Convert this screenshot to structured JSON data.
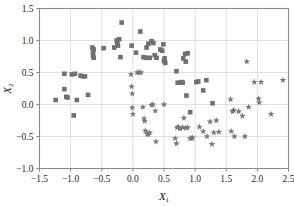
{
  "chart_data": {
    "type": "scatter",
    "title": "",
    "xlabel": "X1",
    "ylabel": "X2",
    "xlabel_base": "X",
    "xlabel_sub": "1",
    "ylabel_base": "X",
    "ylabel_sub": "2",
    "xlim": [
      -1.5,
      2.5
    ],
    "ylim": [
      -1.0,
      1.5
    ],
    "xticks": [
      -1.5,
      -1.0,
      -0.5,
      0.0,
      0.5,
      1.0,
      1.5,
      2.0,
      2.5
    ],
    "xticklabels": [
      "−1.5",
      "−1.0",
      "−0.5",
      "0.0",
      "0.5",
      "1.0",
      "1.5",
      "2.0",
      "2.5"
    ],
    "yticks": [
      -1.0,
      -0.5,
      0.0,
      0.5,
      1.0,
      1.5
    ],
    "yticklabels": [
      "−1.0",
      "−0.5",
      "0.0",
      "0.5",
      "1.0",
      "1.5"
    ],
    "grid": true,
    "grid_color": "#d8d8d8",
    "frame_color": "#8a8a8a",
    "legend": null,
    "series": [
      {
        "name": "class-1",
        "marker": "square",
        "color": "#6f7073",
        "size": 4.6,
        "points": [
          [
            -1.24,
            0.07
          ],
          [
            -1.1,
            0.48
          ],
          [
            -1.1,
            0.24
          ],
          [
            -1.07,
            0.12
          ],
          [
            -1.05,
            0.11
          ],
          [
            -0.98,
            0.47
          ],
          [
            -0.95,
            -0.17
          ],
          [
            -0.93,
            0.48
          ],
          [
            -0.9,
            0.07
          ],
          [
            -0.84,
            0.45
          ],
          [
            -0.8,
            0.44
          ],
          [
            -0.77,
            0.44
          ],
          [
            -0.72,
            0.15
          ],
          [
            -0.65,
            0.89
          ],
          [
            -0.64,
            0.82
          ],
          [
            -0.64,
            0.76
          ],
          [
            -0.63,
            0.73
          ],
          [
            -0.63,
            0.86
          ],
          [
            -0.47,
            0.88
          ],
          [
            -0.3,
            0.89
          ],
          [
            -0.26,
            1.0
          ],
          [
            -0.25,
            0.96
          ],
          [
            -0.24,
            0.92
          ],
          [
            -0.22,
            1.02
          ],
          [
            -0.2,
            0.74
          ],
          [
            -0.18,
            1.28
          ],
          [
            -0.02,
            0.92
          ],
          [
            0.05,
            0.81
          ],
          [
            0.12,
            1.14
          ],
          [
            0.17,
            0.74
          ],
          [
            0.21,
            0.73
          ],
          [
            0.22,
            0.89
          ],
          [
            0.25,
            0.95
          ],
          [
            0.27,
            0.73
          ],
          [
            0.3,
            0.99
          ],
          [
            0.33,
            0.96
          ],
          [
            0.35,
            0.77
          ],
          [
            0.38,
            0.73
          ],
          [
            0.44,
            0.86
          ],
          [
            0.47,
            0.84
          ],
          [
            0.49,
            0.94
          ],
          [
            0.5,
            0.68
          ],
          [
            0.51,
            0.72
          ],
          [
            0.52,
            0.65
          ],
          [
            0.7,
            0.52
          ],
          [
            0.72,
            0.34
          ],
          [
            0.78,
            0.35
          ],
          [
            0.8,
            0.34
          ],
          [
            0.81,
            0.72
          ],
          [
            0.84,
            0.79
          ],
          [
            0.85,
            0.67
          ],
          [
            0.86,
            0.14
          ],
          [
            0.88,
            0.8
          ],
          [
            0.92,
            -0.12
          ],
          [
            1.02,
            0.35
          ],
          [
            1.05,
            0.36
          ],
          [
            1.13,
            0.22
          ],
          [
            1.18,
            0.38
          ],
          [
            1.28,
            0.02
          ]
        ]
      },
      {
        "name": "class-2",
        "marker": "star",
        "color": "#77787c",
        "size": 4.4,
        "points": [
          [
            -0.03,
            0.47
          ],
          [
            -0.02,
            0.28
          ],
          [
            -0.01,
            0.17
          ],
          [
            -0.01,
            -0.05
          ],
          [
            0.0,
            -0.15
          ],
          [
            0.07,
            0.5
          ],
          [
            0.1,
            0.5
          ],
          [
            0.13,
            0.5
          ],
          [
            0.16,
            -0.04
          ],
          [
            0.18,
            -0.22
          ],
          [
            0.19,
            -0.26
          ],
          [
            0.2,
            -0.41
          ],
          [
            0.23,
            -0.46
          ],
          [
            0.25,
            -0.47
          ],
          [
            0.27,
            -0.44
          ],
          [
            0.3,
            -0.01
          ],
          [
            0.32,
            0.0
          ],
          [
            0.36,
            -0.1
          ],
          [
            0.37,
            -0.58
          ],
          [
            0.5,
            0.0
          ],
          [
            0.68,
            -0.53
          ],
          [
            0.7,
            -0.61
          ],
          [
            0.71,
            -0.36
          ],
          [
            0.73,
            -0.35
          ],
          [
            0.76,
            -0.38
          ],
          [
            0.8,
            -0.36
          ],
          [
            0.82,
            -0.21
          ],
          [
            0.85,
            -0.37
          ],
          [
            0.88,
            -0.36
          ],
          [
            0.92,
            -0.53
          ],
          [
            0.94,
            -0.53
          ],
          [
            0.96,
            -0.52
          ],
          [
            1.07,
            -0.35
          ],
          [
            1.13,
            -0.42
          ],
          [
            1.19,
            -0.5
          ],
          [
            1.24,
            -0.27
          ],
          [
            1.27,
            -0.62
          ],
          [
            1.3,
            -0.44
          ],
          [
            1.34,
            -0.25
          ],
          [
            1.38,
            -0.43
          ],
          [
            1.57,
            0.08
          ],
          [
            1.58,
            -0.42
          ],
          [
            1.6,
            -0.11
          ],
          [
            1.62,
            -0.09
          ],
          [
            1.63,
            -0.5
          ],
          [
            1.7,
            -0.11
          ],
          [
            1.76,
            -0.18
          ],
          [
            1.8,
            -0.5
          ],
          [
            1.83,
            0.67
          ],
          [
            1.86,
            -0.04
          ],
          [
            1.95,
            0.35
          ],
          [
            2.02,
            0.09
          ],
          [
            2.03,
            0.03
          ],
          [
            2.06,
            0.35
          ],
          [
            2.22,
            -0.15
          ],
          [
            2.41,
            0.38
          ]
        ]
      }
    ]
  }
}
